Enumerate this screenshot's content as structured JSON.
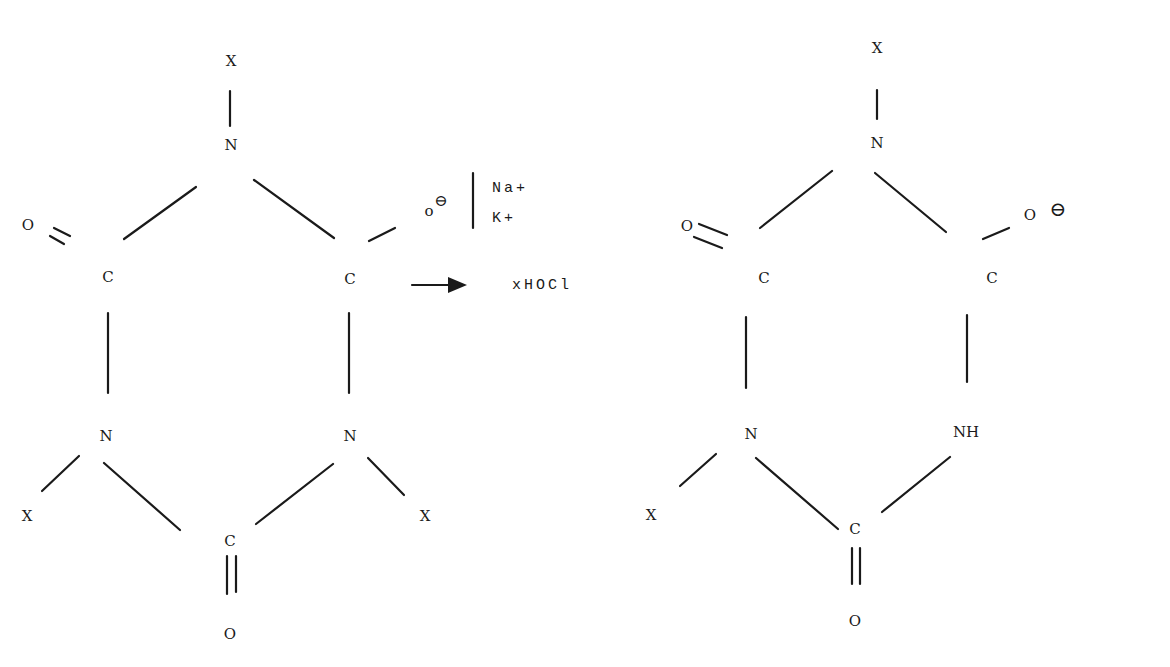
{
  "diagram": {
    "type": "chemical-reaction",
    "reactant": {
      "atoms": {
        "x_top": "X",
        "n_top": "N",
        "o_left": "O",
        "c_left": "C",
        "c_right": "C",
        "o_right": "o",
        "n_left": "N",
        "n_right": "N",
        "x_left": "X",
        "x_right": "X",
        "c_bottom": "C",
        "o_bottom": "O"
      },
      "charge": "⊖",
      "counterions": [
        "Na+",
        "K+"
      ]
    },
    "reagent": {
      "label": "xHOCl"
    },
    "product": {
      "atoms": {
        "x_top": "X",
        "n_top": "N",
        "o_left": "O",
        "c_left": "C",
        "c_right": "C",
        "o_right": "O",
        "n_left": "N",
        "nh_right": "NH",
        "x_left": "X",
        "c_bottom": "C",
        "o_bottom": "O"
      },
      "charge": "⊖"
    }
  }
}
